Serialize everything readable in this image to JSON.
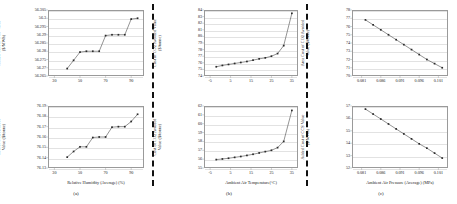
{
  "figure": {
    "panel_labels": [
      "(a)",
      "(b)",
      "(c)"
    ],
    "accent": "#3a3a3a",
    "grid_color": "#e2e2e2",
    "axis_color": "#9a9a9a"
  },
  "chart_data": [
    {
      "id": "a-top",
      "type": "line",
      "title": "",
      "xlabel": "",
      "ylabel": "Added Cost of CCS  Value\n($/MWh)",
      "xlim": [
        25,
        100
      ],
      "ylim": [
        56.265,
        56.305
      ],
      "xticks": [
        30,
        50,
        70,
        90
      ],
      "xticklabels": [
        "30",
        "50",
        "70",
        "90"
      ],
      "yticks": [
        56.265,
        56.27,
        56.275,
        56.28,
        56.285,
        56.29,
        56.295,
        56.3,
        56.305
      ],
      "yticklabels": [
        "56.265",
        "56.27",
        "56.275",
        "56.28",
        "56.285",
        "56.29",
        "56.295",
        "56.3",
        "56.305"
      ],
      "grid": true,
      "legend": "none",
      "x": [
        40,
        45,
        50,
        55,
        60,
        65,
        70,
        75,
        80,
        85,
        90,
        95
      ],
      "y": [
        56.2695,
        56.2745,
        56.2795,
        56.28,
        56.28,
        56.28,
        56.2895,
        56.29,
        56.29,
        56.29,
        56.2995,
        56.3
      ]
    },
    {
      "id": "a-bottom",
      "type": "line",
      "title": "",
      "xlabel": "Relative Humidity (Average) (%)",
      "ylabel": "Cost of CO2 Avoided\nValue ($/tonne)",
      "xlim": [
        25,
        100
      ],
      "ylim": [
        76.13,
        76.19
      ],
      "xticks": [
        30,
        50,
        70,
        90
      ],
      "xticklabels": [
        "30",
        "50",
        "70",
        "90"
      ],
      "yticks": [
        76.13,
        76.14,
        76.15,
        76.16,
        76.17,
        76.18,
        76.19
      ],
      "yticklabels": [
        "76.13",
        "76.14",
        "76.15",
        "76.16",
        "76.17",
        "76.18",
        "76.19"
      ],
      "grid": true,
      "legend": "none",
      "x": [
        40,
        45,
        50,
        55,
        60,
        65,
        70,
        75,
        80,
        85,
        90,
        95
      ],
      "y": [
        76.1405,
        76.146,
        76.1505,
        76.1505,
        76.1595,
        76.16,
        76.16,
        76.1695,
        76.17,
        76.17,
        76.175,
        76.182
      ]
    },
    {
      "id": "b-top",
      "type": "line",
      "title": "",
      "xlabel": "",
      "ylabel": "Cost of CO2 Avoided Value\n($/tonne)",
      "xlim": [
        -8,
        38
      ],
      "ylim": [
        74,
        84
      ],
      "xticks": [
        -5,
        5,
        15,
        25,
        35
      ],
      "xticklabels": [
        "-5",
        "5",
        "15",
        "25",
        "35"
      ],
      "yticks": [
        74,
        75,
        76,
        77,
        78,
        79,
        80,
        81,
        82,
        83,
        84
      ],
      "yticklabels": [
        "74",
        "75",
        "76",
        "77",
        "78",
        "79",
        "80",
        "81",
        "82",
        "83",
        "84"
      ],
      "grid": true,
      "legend": "none",
      "x": [
        -2,
        1,
        4,
        7,
        10,
        13,
        16,
        19,
        22,
        25,
        28,
        31,
        35
      ],
      "y": [
        75.4,
        75.6,
        75.75,
        75.9,
        76.05,
        76.2,
        76.4,
        76.6,
        76.75,
        77.0,
        77.4,
        78.6,
        83.5
      ]
    },
    {
      "id": "b-bottom",
      "type": "line",
      "title": "",
      "xlabel": "Ambient Air Temperature(°C)",
      "ylabel": "Cost of CO2 Avoided\nValue ($/tonne)",
      "xlim": [
        -8,
        38
      ],
      "ylim": [
        55,
        62
      ],
      "xticks": [
        -5,
        5,
        15,
        25,
        35
      ],
      "xticklabels": [
        "-5",
        "5",
        "15",
        "25",
        "35"
      ],
      "yticks": [
        55,
        56,
        57,
        58,
        59,
        60,
        61,
        62
      ],
      "yticklabels": [
        "55",
        "56",
        "57",
        "58",
        "59",
        "60",
        "61",
        "62"
      ],
      "grid": true,
      "legend": "none",
      "x": [
        -2,
        1,
        4,
        7,
        10,
        13,
        16,
        19,
        22,
        25,
        28,
        31,
        35
      ],
      "y": [
        55.95,
        56.02,
        56.1,
        56.2,
        56.3,
        56.42,
        56.55,
        56.7,
        56.85,
        57.0,
        57.3,
        58.0,
        61.5
      ]
    },
    {
      "id": "c-top",
      "type": "line",
      "title": "",
      "xlabel": "",
      "ylabel": "Area Cost of CO2 Avoided\nValue ($/tonne)",
      "xlim": [
        0.0785,
        0.1035
      ],
      "ylim": [
        70,
        78
      ],
      "xticks": [
        0.081,
        0.086,
        0.091,
        0.096,
        0.101
      ],
      "xticklabels": [
        "0.081",
        "0.086",
        "0.091",
        "0.096",
        "0.101"
      ],
      "yticks": [
        70,
        71,
        72,
        73,
        74,
        75,
        76,
        77,
        78
      ],
      "yticklabels": [
        "70",
        "71",
        "72",
        "73",
        "74",
        "75",
        "76",
        "77",
        "78"
      ],
      "grid": true,
      "legend": "none",
      "x": [
        0.082,
        0.084,
        0.086,
        0.088,
        0.09,
        0.092,
        0.094,
        0.096,
        0.098,
        0.1,
        0.102
      ],
      "y": [
        76.8,
        76.2,
        75.6,
        75.0,
        74.4,
        73.8,
        73.2,
        72.6,
        72.0,
        71.5,
        71.0
      ]
    },
    {
      "id": "c-bottom",
      "type": "line",
      "title": "",
      "xlabel": "Ambient Air Pressure (Average) (MPa)",
      "ylabel": "Added Cost of CCS Value\n($/MWh)",
      "xlim": [
        0.0785,
        0.1035
      ],
      "ylim": [
        52,
        57
      ],
      "xticks": [
        0.081,
        0.086,
        0.091,
        0.096,
        0.101
      ],
      "xticklabels": [
        "0.081",
        "0.086",
        "0.091",
        "0.096",
        "0.101"
      ],
      "yticks": [
        52,
        53,
        54,
        55,
        56,
        57
      ],
      "yticklabels": [
        "52",
        "53",
        "54",
        "55",
        "56",
        "57"
      ],
      "grid": true,
      "legend": "none",
      "x": [
        0.082,
        0.084,
        0.086,
        0.088,
        0.09,
        0.092,
        0.094,
        0.096,
        0.098,
        0.1,
        0.102
      ],
      "y": [
        56.75,
        56.35,
        55.95,
        55.55,
        55.15,
        54.75,
        54.35,
        53.95,
        53.6,
        53.2,
        52.8
      ]
    }
  ]
}
